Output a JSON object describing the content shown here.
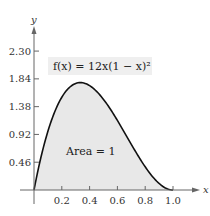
{
  "chart_data": {
    "type": "area",
    "title": "",
    "function_label": "f(x) = 12x(1 − x)²",
    "annotation": "Area = 1",
    "xlabel": "x",
    "ylabel": "y",
    "x_ticks": [
      0.2,
      0.4,
      0.6,
      0.8,
      1.0
    ],
    "x_tick_labels": [
      "0.2",
      "0.4",
      "0.6",
      "0.8",
      "1.0"
    ],
    "y_ticks": [
      0.46,
      0.92,
      1.38,
      1.84,
      2.3
    ],
    "y_tick_labels": [
      "0.46",
      "0.92",
      "1.38",
      "1.84",
      "2.30"
    ],
    "xlim": [
      0,
      1.0
    ],
    "ylim": [
      0,
      2.3
    ],
    "grid": false,
    "series": [
      {
        "name": "f(x) = 12x(1 − x)²",
        "x": [
          0,
          0.05,
          0.1,
          0.15,
          0.2,
          0.25,
          0.3,
          0.3333,
          0.35,
          0.4,
          0.45,
          0.5,
          0.55,
          0.6,
          0.65,
          0.7,
          0.75,
          0.8,
          0.85,
          0.9,
          0.95,
          1.0
        ],
        "values": [
          0,
          0.5415,
          0.972,
          1.3005,
          1.536,
          1.6875,
          1.764,
          1.7778,
          1.7745,
          1.728,
          1.6335,
          1.5,
          1.3365,
          1.152,
          0.9555,
          0.756,
          0.5625,
          0.384,
          0.2295,
          0.108,
          0.0285,
          0
        ],
        "fill": "#e8e8e8",
        "stroke": "#111111"
      }
    ],
    "colors": {
      "fill": "#e8e8e8",
      "curve": "#111111",
      "axis": "#555555",
      "label_bg": "#efefef"
    }
  }
}
